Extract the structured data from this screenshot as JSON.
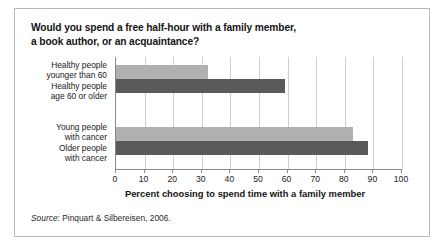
{
  "figure": {
    "title_line1": "Would you spend a free half-hour with a family member,",
    "title_line2": "a book author, or an acquaintance?",
    "source_word": "Source",
    "source_text": ": Pinquart & Silbereisen, 2006."
  },
  "chart_data": {
    "type": "bar",
    "orientation": "horizontal",
    "title": "Would you spend a free half-hour with a family member, a book author, or an acquaintance?",
    "categories": [
      "Healthy people younger than 60",
      "Healthy people age 60 or older",
      "Young people with cancer",
      "Older people with cancer"
    ],
    "category_lines": [
      [
        "Healthy people",
        "younger than 60"
      ],
      [
        "Healthy people",
        "age 60 or older"
      ],
      [
        "Young people",
        "with cancer"
      ],
      [
        "Older people",
        "with cancer"
      ]
    ],
    "values": [
      32,
      59,
      83,
      88
    ],
    "bar_colors": [
      "#b0b0b0",
      "#5a5a5a",
      "#b0b0b0",
      "#5a5a5a"
    ],
    "xlabel": "Percent choosing to spend time with a family member",
    "ylabel": "",
    "xlim": [
      0,
      100
    ],
    "xticks": [
      0,
      10,
      20,
      30,
      40,
      50,
      60,
      70,
      80,
      90,
      100
    ],
    "xtick_labels": [
      "0",
      "10",
      "20",
      "30",
      "40",
      "50",
      "60",
      "70",
      "80",
      "90",
      "100"
    ],
    "grid": "vertical",
    "legend": "none"
  }
}
